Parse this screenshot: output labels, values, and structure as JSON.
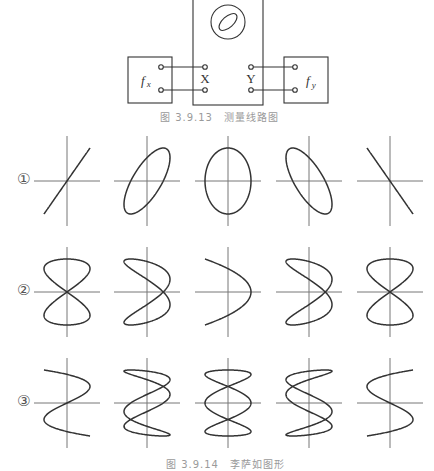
{
  "circuit": {
    "oscilloscope_label": "oscilloscope",
    "x_input_label": "X",
    "y_input_label": "Y",
    "fx_label": "f",
    "fx_sub": "x",
    "fy_label": "f",
    "fy_sub": "y",
    "caption": "图 3.9.13　测量线路图"
  },
  "rows": [
    {
      "label": "①",
      "ratio_fx": 1,
      "ratio_fy": 1,
      "phases_deg": [
        0,
        45,
        90,
        135,
        180
      ]
    },
    {
      "label": "②",
      "ratio_fx": 2,
      "ratio_fy": 1,
      "phases_deg": [
        0,
        45,
        90,
        135,
        180
      ]
    },
    {
      "label": "③",
      "ratio_fx": 3,
      "ratio_fy": 1,
      "phases_deg": [
        0,
        45,
        90,
        135,
        180
      ]
    }
  ],
  "bottom_caption": "图 3.9.14　李萨如图形",
  "colors": {
    "line": "#333333",
    "axis": "#777777",
    "caption": "#9a9a9a"
  }
}
